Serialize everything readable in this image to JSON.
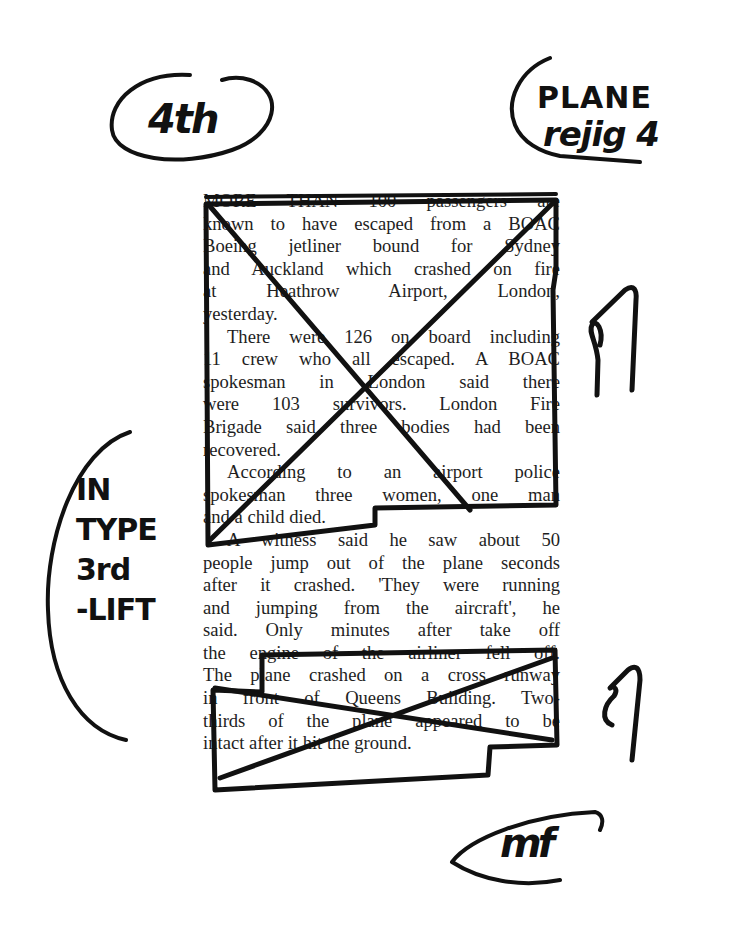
{
  "document": {
    "type": "newspaper proof clipping with editorial marks",
    "article": {
      "paragraphs": [
        {
          "status": "deleted",
          "lines": [
            "MORE THAN 100 passengers are",
            "known to have escaped from a BOAC",
            "Boeing jetliner bound for Sydney",
            "and Auckland which crashed on fire",
            "at Heathrow Airport, London,",
            "yesterday."
          ]
        },
        {
          "status": "deleted",
          "lines": [
            "There were 126 on board including",
            "11 crew who all escaped. A BOAC",
            "spokesman in London said there",
            "were 103 survivors. London Fire",
            "Brigade said three bodies had been",
            "recovered."
          ]
        },
        {
          "status": "deleted",
          "lines": [
            "According to an airport police",
            "spokesman three women, one man",
            "and a child died."
          ]
        },
        {
          "status": "kept",
          "lines": [
            "A witness said he saw about 50",
            "people jump out of the plane seconds",
            "after it crashed. 'They were running",
            "and jumping from the aircraft', he",
            "said. Only minutes after take off"
          ]
        },
        {
          "status": "deleted",
          "lines": [
            "the engine of the airliner fell off.",
            "The plane crashed on a cross runway",
            "in front of Queens Building. Two-",
            "thirds of the plane appeared to be",
            "intact after it hit the ground."
          ]
        }
      ]
    },
    "annotations": {
      "top_left": "4th",
      "top_right_line1": "PLANE",
      "top_right_line2": "rejig 4",
      "left_margin": [
        "IN",
        "TYPE",
        "3rd",
        "-LIFT"
      ],
      "delete_mark_1": "δ",
      "delete_mark_2": "δ",
      "bottom_initials": "mf"
    },
    "colors": {
      "ink": "#111111",
      "print": "#1e1e1e",
      "paper": "#ffffff"
    }
  }
}
